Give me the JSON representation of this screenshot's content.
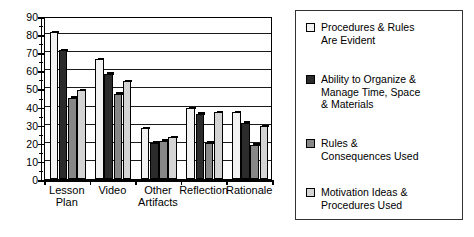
{
  "chart_data": {
    "type": "bar",
    "title": "",
    "xlabel": "",
    "ylabel": "",
    "ylim": [
      0,
      90
    ],
    "yticks": [
      0,
      10,
      20,
      30,
      40,
      50,
      60,
      70,
      80,
      90
    ],
    "grid": true,
    "legend_position": "right",
    "categories": [
      "Lesson\nPlan",
      "Video",
      "Other\nArtifacts",
      "Reflection",
      "Rationale"
    ],
    "series": [
      {
        "name": "Procedures & Rules\nAre Evident",
        "color": "#f2f2f2",
        "values": [
          81,
          66,
          28,
          39,
          37
        ]
      },
      {
        "name": "Ability to Organize &\nManage Time, Space\n& Materials",
        "color": "#2b2b2b",
        "values": [
          71,
          58,
          20,
          36,
          31
        ]
      },
      {
        "name": "Rules &\nConsequences Used",
        "color": "#878787",
        "values": [
          45,
          47,
          21,
          20,
          19
        ]
      },
      {
        "name": "Motivation Ideas &\nProcedures Used",
        "color": "#d4d4d4",
        "values": [
          49,
          54,
          23,
          37,
          29
        ]
      }
    ]
  },
  "legend": {
    "items": [
      {
        "label": "Procedures & Rules\nAre Evident",
        "color": "#f2f2f2"
      },
      {
        "label": "Ability to Organize &\nManage Time, Space\n& Materials",
        "color": "#2b2b2b"
      },
      {
        "label": "Rules &\nConsequences Used",
        "color": "#878787"
      },
      {
        "label": "Motivation Ideas &\nProcedures Used",
        "color": "#d4d4d4"
      }
    ]
  },
  "axis": {
    "y_tick_labels": [
      "0",
      "10",
      "20",
      "30",
      "40",
      "50",
      "60",
      "70",
      "80",
      "90"
    ],
    "x_tick_labels": [
      "Lesson\nPlan",
      "Video",
      "Other\nArtifacts",
      "Reflection",
      "Rationale"
    ]
  }
}
